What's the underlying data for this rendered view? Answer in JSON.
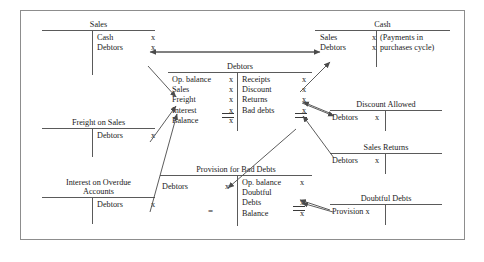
{
  "diagram": {
    "frame_color": "#8d8d8d",
    "rule_color": "#5a5a5a",
    "arrow_color": "#4a4a4a",
    "amount_symbol": "x"
  },
  "accounts": {
    "sales": {
      "name": "Sales",
      "debit": [],
      "credit": [
        {
          "label": "Cash",
          "amount": "x"
        },
        {
          "label": "Debtors",
          "amount": "x"
        }
      ]
    },
    "cash": {
      "name": "Cash",
      "debit": [
        {
          "label": "Sales",
          "amount": "x"
        },
        {
          "label": "Debtors",
          "amount": "x"
        }
      ],
      "credit_note": "(Payments in purchases cycle)"
    },
    "debtors": {
      "name": "Debtors",
      "debit": [
        {
          "label": "Op. balance",
          "amount": "x"
        },
        {
          "label": "Sales",
          "amount": "x"
        },
        {
          "label": "Freight",
          "amount": "x"
        },
        {
          "label": "Interest",
          "amount": "x",
          "double_underline": true
        },
        {
          "label": "Balance",
          "amount": "x"
        }
      ],
      "credit": [
        {
          "label": "Receipts",
          "amount": "x"
        },
        {
          "label": "Discount",
          "amount": "x"
        },
        {
          "label": "Returns",
          "amount": "x"
        },
        {
          "label": "Bad debts",
          "amount": "x",
          "double_underline": true
        }
      ]
    },
    "freight_on_sales": {
      "name": "Freight on Sales",
      "debit": [],
      "credit": [
        {
          "label": "Debtors",
          "amount": "x"
        }
      ]
    },
    "interest_on_overdue": {
      "name": "Interest on Overdue Accounts",
      "name_line1": "Interest on Overdue",
      "name_line2": "Accounts",
      "debit": [],
      "credit": [
        {
          "label": "Debtors",
          "amount": "x"
        }
      ]
    },
    "discount_allowed": {
      "name": "Discount Allowed",
      "debit": [
        {
          "label": "Debtors",
          "amount": "x"
        }
      ],
      "credit": []
    },
    "sales_returns": {
      "name": "Sales Returns",
      "debit": [
        {
          "label": "Debtors",
          "amount": "x"
        }
      ],
      "credit": []
    },
    "doubtful_debts": {
      "name": "Doubtful Debts",
      "debit": [
        {
          "label": "Provision x",
          "amount": ""
        }
      ],
      "credit": []
    },
    "provision_for_bad_debts": {
      "name": "Provision for Bad Debts",
      "equals_sign": "=",
      "debit": [
        {
          "label": "Debtors",
          "amount": "x"
        }
      ],
      "credit": [
        {
          "label": "Op. balance",
          "amount": "x"
        },
        {
          "label": "Doubtful",
          "amount": ""
        },
        {
          "label": "Debts",
          "amount": "x",
          "double_underline": true
        },
        {
          "label": "Balance",
          "amount": "x"
        }
      ]
    }
  }
}
